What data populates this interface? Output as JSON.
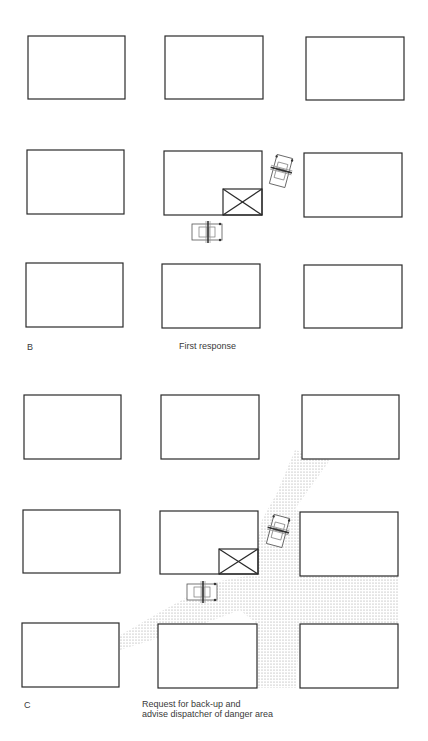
{
  "panels": [
    {
      "id": "B",
      "letter": "B",
      "caption": "First response",
      "has_danger_area": false
    },
    {
      "id": "C",
      "letter": "C",
      "caption_line1": "Request for back-up and",
      "caption_line2": "advise dispatcher of danger area",
      "has_danger_area": true
    }
  ],
  "legend": {
    "building": "city block",
    "incident": "target building (X)",
    "vehicle": "police car",
    "danger_area": "stippled danger area"
  },
  "colors": {
    "line": "#2a2a2a",
    "stipple": "#9a9a9a",
    "background": "#ffffff"
  }
}
